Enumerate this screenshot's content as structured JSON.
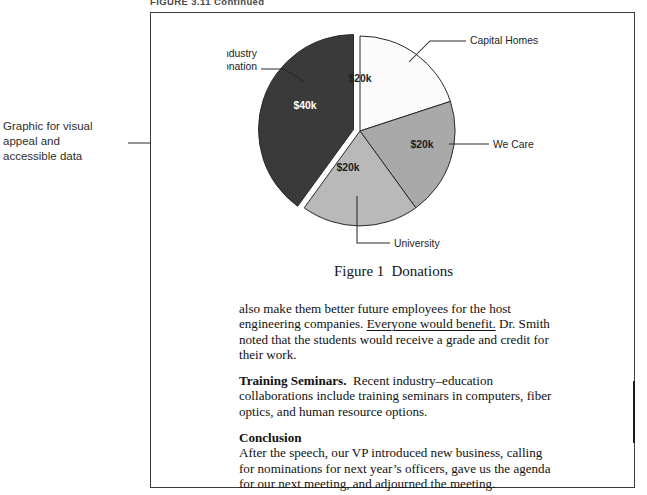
{
  "running_head": "FIGURE 3.11  Continued",
  "annotation": {
    "lines": [
      "Graphic for visual",
      "appeal and",
      "accessible data"
    ],
    "arrow_icon": "arrow-right-icon"
  },
  "figure": {
    "caption_number": "Figure 1",
    "caption_title": "Donations"
  },
  "chart_data": {
    "type": "pie",
    "categories": [
      "Capital Homes",
      "We Care",
      "University",
      "Industry Donation"
    ],
    "values": [
      20,
      20,
      20,
      40
    ],
    "value_labels": [
      "$20k",
      "$20k",
      "$20k",
      "$40k"
    ],
    "unit": "thousand dollars",
    "total": 100,
    "percentages": [
      20,
      20,
      20,
      40
    ],
    "start_angle_deg": 0,
    "direction": "clockwise",
    "exploded_slice": "Industry Donation",
    "legend": "none",
    "labels_position": "outside-with-leader-lines",
    "slice_colors": [
      "#fbfbfb",
      "#a9a9a9",
      "#b9b9b9",
      "#3a3a3a"
    ],
    "slice_label_colors": [
      "#1d1d1d",
      "#1d1d1d",
      "#1d1d1d",
      "#ffffff"
    ],
    "slices": [
      {
        "name": "Capital Homes",
        "value": 20,
        "label": "$20k",
        "percent": 20,
        "color": "#fbfbfb",
        "exploded": false
      },
      {
        "name": "We Care",
        "value": 20,
        "label": "$20k",
        "percent": 20,
        "color": "#a9a9a9",
        "exploded": false
      },
      {
        "name": "University",
        "value": 20,
        "label": "$20k",
        "percent": 20,
        "color": "#b9b9b9",
        "exploded": false
      },
      {
        "name": "Industry Donation",
        "value": 40,
        "label": "$40k",
        "percent": 40,
        "color": "#3a3a3a",
        "exploded": true
      }
    ]
  },
  "body": {
    "para1_a": "also make them better future employees for the host engineering companies. ",
    "para1_underlined": "Everyone would benefit.",
    "para1_b": " Dr. Smith noted that the students would receive a grade and credit for their work.",
    "para2_runin": "Training Seminars.",
    "para2_text": "Recent industry–education collaborations include training seminars in computers, fiber optics, and human resource options.",
    "para3_head": "Conclusion",
    "para3_text": "After the speech, our VP introduced new business, calling for nominations for next year’s officers, gave us the agenda for our next meeting, and adjourned the meeting."
  }
}
